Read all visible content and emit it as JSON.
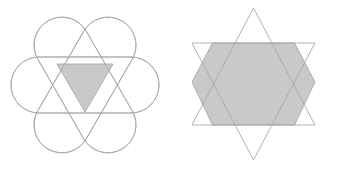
{
  "canvas": {
    "width": 337,
    "height": 169,
    "background_color": "#ffffff"
  },
  "style": {
    "stroke_color": "#a8a8a8",
    "stroke_width": 0.9,
    "shade_color": "#c9c9c9"
  },
  "figures": [
    {
      "id": "left-figure",
      "name": "three-overlapping-stadiums-flower",
      "description": "Three congruent stadium shapes rotated 60 degrees apart about a common center, forming a six-lobed flower; the central overlap region is a shaded downward-pointing triangle.",
      "center": {
        "x": 85,
        "y": 85
      },
      "stadium": {
        "count": 3,
        "length": 148,
        "width": 56,
        "cap_radius": 28,
        "rotations_deg": [
          0,
          60,
          120
        ]
      },
      "shaded_region": {
        "shape": "triangle",
        "orientation": "point-down",
        "vertices": [
          {
            "x": 57,
            "y": 64
          },
          {
            "x": 113,
            "y": 64
          },
          {
            "x": 85,
            "y": 112
          }
        ]
      }
    },
    {
      "id": "right-figure",
      "name": "star-of-david-hexagram",
      "description": "Two overlapping equilateral triangles, one pointing up and one pointing down, forming a hexagram; the central overlap region is a shaded regular hexagon.",
      "center": {
        "x": 253.5,
        "y": 84
      },
      "triangles": [
        {
          "name": "upward-triangle",
          "orientation": "point-up",
          "vertices": [
            {
              "x": 253.5,
              "y": 8
            },
            {
              "x": 192,
              "y": 125
            },
            {
              "x": 315,
              "y": 125
            }
          ]
        },
        {
          "name": "downward-triangle",
          "orientation": "point-down",
          "vertices": [
            {
              "x": 192,
              "y": 43
            },
            {
              "x": 315,
              "y": 43
            },
            {
              "x": 253.5,
              "y": 160
            }
          ]
        }
      ],
      "shaded_region": {
        "shape": "hexagon",
        "vertices": [
          {
            "x": 212.5,
            "y": 43
          },
          {
            "x": 294.5,
            "y": 43
          },
          {
            "x": 315,
            "y": 82
          },
          {
            "x": 294.5,
            "y": 125
          },
          {
            "x": 212.5,
            "y": 125
          },
          {
            "x": 192,
            "y": 82
          }
        ]
      }
    }
  ]
}
